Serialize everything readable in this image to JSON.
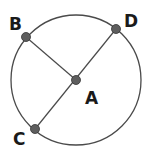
{
  "diagram": {
    "type": "circle-with-points",
    "colors": {
      "stroke": "#4a4a4a",
      "point_fill": "#5e5e5e",
      "point_stroke": "#333333",
      "label": "#1a1a1a",
      "background": "#ffffff"
    },
    "circle": {
      "cx": 76,
      "cy": 80,
      "r": 65
    },
    "points": [
      {
        "id": "A",
        "label": "A",
        "x": 76,
        "y": 80,
        "label_x": 85,
        "label_y": 104
      },
      {
        "id": "B",
        "label": "B",
        "x": 26,
        "y": 37,
        "label_x": 9,
        "label_y": 30
      },
      {
        "id": "C",
        "label": "C",
        "x": 35,
        "y": 129,
        "label_x": 13,
        "label_y": 145
      },
      {
        "id": "D",
        "label": "D",
        "x": 116,
        "y": 29,
        "label_x": 124,
        "label_y": 27
      }
    ],
    "segments": [
      {
        "from": "B",
        "to": "A"
      },
      {
        "from": "C",
        "to": "D"
      }
    ]
  }
}
